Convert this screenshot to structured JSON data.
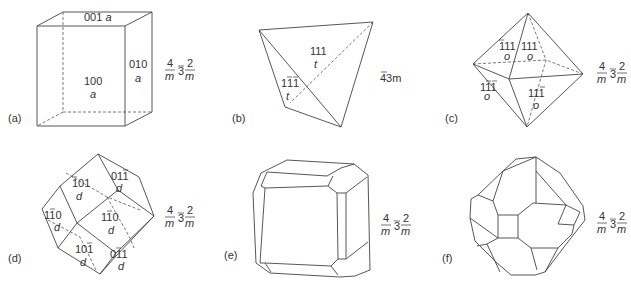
{
  "figure": {
    "panels": [
      {
        "id": "a",
        "label": "(a)",
        "form": "cube",
        "faces": [
          {
            "index": "001",
            "letter": "a"
          },
          {
            "index": "010",
            "letter": "a"
          },
          {
            "index": "100",
            "letter": "a"
          }
        ],
        "symmetry": {
          "num1": "4",
          "den1": "m",
          "mid": "3",
          "num2": "2",
          "den2": "m"
        }
      },
      {
        "id": "b",
        "label": "(b)",
        "form": "tetrahedron",
        "faces": [
          {
            "index": "111",
            "letter": "t"
          },
          {
            "index": "11̄1̄",
            "letter": "t"
          }
        ],
        "symmetry": {
          "text": "43m"
        }
      },
      {
        "id": "c",
        "label": "(c)",
        "form": "octahedron",
        "faces": [
          {
            "index": "1̄11",
            "letter": "o"
          },
          {
            "index": "111",
            "letter": "o"
          },
          {
            "index": "11̄1",
            "letter": "o"
          },
          {
            "index": "111̄",
            "letter": "o"
          }
        ],
        "symmetry": {
          "num1": "4",
          "den1": "m",
          "mid": "3",
          "num2": "2",
          "den2": "m"
        }
      },
      {
        "id": "d",
        "label": "(d)",
        "form": "dodecahedron",
        "faces": [
          {
            "index": "1̄01",
            "letter": "d"
          },
          {
            "index": "011̄",
            "letter": "d"
          },
          {
            "index": "11̄0",
            "letter": "d"
          },
          {
            "index": "1̄10",
            "letter": "d"
          },
          {
            "index": "101̄",
            "letter": "d"
          },
          {
            "index": "01̄1",
            "letter": "d"
          }
        ],
        "symmetry": {
          "num1": "4",
          "den1": "m",
          "mid": "3",
          "num2": "2",
          "den2": "m"
        }
      },
      {
        "id": "e",
        "label": "(e)",
        "form": "cube with dodecahedron and octahedron",
        "faces": [
          "a",
          "d",
          "o",
          "o",
          "d",
          "a",
          "d",
          "d",
          "a",
          "o",
          "d",
          "o"
        ],
        "symmetry": {
          "num1": "4",
          "den1": "m",
          "mid": "3",
          "num2": "2",
          "den2": "m"
        }
      },
      {
        "id": "f",
        "label": "(f)",
        "form": "dodecahedron with cube and octahedron",
        "faces": [
          "a",
          "o",
          "d",
          "o",
          "d",
          "d",
          "a",
          "d",
          "a",
          "o",
          "d",
          "o"
        ],
        "symmetry": {
          "num1": "4",
          "den1": "m",
          "mid": "3",
          "num2": "2",
          "den2": "m"
        }
      }
    ]
  }
}
